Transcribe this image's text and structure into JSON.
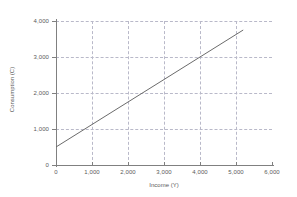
{
  "chart_data": {
    "type": "line",
    "title": "",
    "xlabel": "Income (Y)",
    "ylabel": "Consumption (C)",
    "xlim": [
      0,
      6000
    ],
    "ylim": [
      0,
      4000
    ],
    "xticks": [
      0,
      1000,
      2000,
      3000,
      4000,
      5000,
      6000
    ],
    "xtick_labels": [
      "0",
      "1,000",
      "2,000",
      "3,000",
      "4,000",
      "5,000",
      "6,000"
    ],
    "yticks": [
      0,
      1000,
      2000,
      3000,
      4000
    ],
    "ytick_labels": [
      "0",
      "1,000",
      "2,000",
      "3,000",
      "4,000"
    ],
    "grid": true,
    "grid_style": "dashed",
    "grid_color": "#b9b9c9",
    "legend": false,
    "series": [
      {
        "name": "Consumption function",
        "color": "#6b6b6b",
        "intercept": 500,
        "slope": 0.625,
        "x": [
          0,
          1000,
          2000,
          3000,
          4000,
          5000,
          5200
        ],
        "values": [
          500,
          1125,
          1750,
          2375,
          3000,
          3625,
          3750
        ]
      }
    ]
  },
  "axes": {
    "x_title": "Income (Y)",
    "y_title": "Consumption (C)"
  }
}
